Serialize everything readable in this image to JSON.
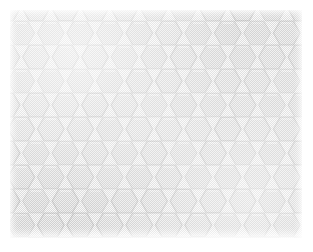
{
  "image": {
    "kind": "texture-swatch",
    "subject": "hexagonal honeycomb tile pattern",
    "alt_text": "Light gray hexagonal honeycomb tile texture with white grout gaps on a white background",
    "width_px": 313,
    "height_px": 252
  },
  "canvas": {
    "background_color": "#ffffff",
    "margin_px": 10
  },
  "swatch": {
    "left_px": 10,
    "top_px": 10,
    "width_px": 292,
    "height_px": 228,
    "base_color": "#fbfbfb"
  },
  "pattern": {
    "name": "honeycomb-hexagon-lattice",
    "orientation": "flat-top",
    "hex_width_px": 29,
    "hex_height_px": 26,
    "column_pitch_px": 29.5,
    "row_pitch_px": 24,
    "columns": 12,
    "rows": 11,
    "gap_px": 2.4,
    "fill_color": "#e9e9e9",
    "fill_color_alt": "#ededed",
    "stroke_color": "#cfcfcf",
    "grout_color": "#ffffff",
    "highlight_color": "#f7f7f7"
  },
  "texture": {
    "halftone": "checkerboard-dither",
    "halftone_cell_px": 2,
    "halftone_opacity": 0.85,
    "noise_color": "#787878"
  }
}
